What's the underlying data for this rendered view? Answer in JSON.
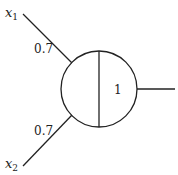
{
  "diagram": {
    "type": "perceptron-neuron",
    "inputs": [
      {
        "name": "x",
        "subscript": "1",
        "weight": "0.7"
      },
      {
        "name": "x",
        "subscript": "2",
        "weight": "0.7"
      }
    ],
    "neuron": {
      "threshold": "1"
    },
    "colors": {
      "stroke": "#222222",
      "background": "#ffffff"
    }
  }
}
